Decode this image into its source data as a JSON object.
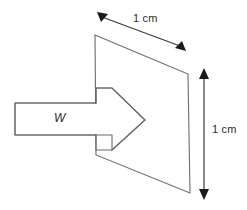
{
  "figure": {
    "background_color": "#ffffff",
    "outline_color": "#6b6b6b",
    "dimension_color": "#1a1a1a",
    "label_color": "#2b2b2b",
    "shapes": {
      "plate": {
        "name": "square-plate-parallelogram",
        "points": "95,35 188,74 190,193 96,155"
      },
      "arrow": {
        "name": "block-arrow-pointing-right",
        "points": "15,103 96,103 96,88 112,88 112,88 145,120 112,150 112,135 96,135 15,135"
      }
    },
    "dimensions": {
      "top": {
        "label": "1 cm",
        "line": {
          "x1": 101,
          "y1": 16,
          "x2": 181,
          "y2": 46
        },
        "arrow_start": {
          "x": 99,
          "y": 14
        },
        "arrow_end": {
          "x": 184,
          "y": 49
        }
      },
      "right": {
        "label": "1 cm",
        "line": {
          "x1": 204,
          "y1": 74,
          "x2": 204,
          "y2": 194
        },
        "arrow_top": {
          "x": 204,
          "y": 71
        },
        "arrow_bottom": {
          "x": 204,
          "y": 197
        }
      }
    },
    "annotations": {
      "arrow_label": "W"
    }
  }
}
